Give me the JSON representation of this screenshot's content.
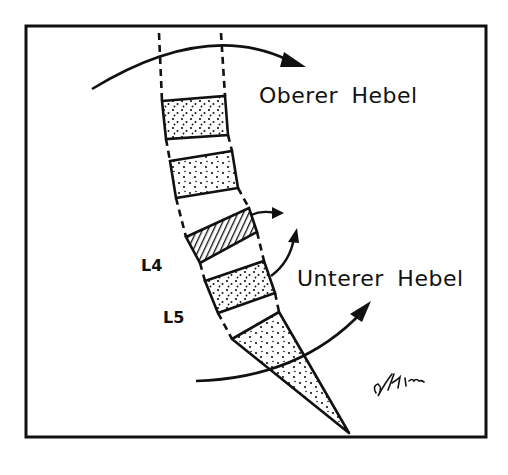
{
  "diagram": {
    "labels": {
      "upper_lever": "Oberer Hebel",
      "lower_lever": "Unterer Hebel",
      "vertebra_l4": "L4",
      "vertebra_l5": "L5",
      "signature": "signature scribble"
    },
    "colors": {
      "line": "#111111",
      "background": "#ffffff"
    },
    "elements": [
      {
        "type": "frame"
      },
      {
        "type": "vertebra-dotted",
        "position": 1
      },
      {
        "type": "disc",
        "position": 1
      },
      {
        "type": "vertebra-dotted",
        "position": 2
      },
      {
        "type": "disc",
        "position": 2
      },
      {
        "type": "vertebra-hatched",
        "position": 3
      },
      {
        "type": "disc",
        "position": 3
      },
      {
        "type": "vertebra-dotted",
        "position": 4
      },
      {
        "type": "disc",
        "position": 4
      },
      {
        "type": "sacrum-dotted"
      },
      {
        "type": "arrow-curved",
        "name": "upper-lever-arrow"
      },
      {
        "type": "arrow-curved",
        "name": "lower-lever-arrow"
      },
      {
        "type": "arrow-small",
        "name": "hatched-vertebra-arrow"
      },
      {
        "type": "arrow-small",
        "name": "l4-rotation-arrow"
      }
    ]
  }
}
